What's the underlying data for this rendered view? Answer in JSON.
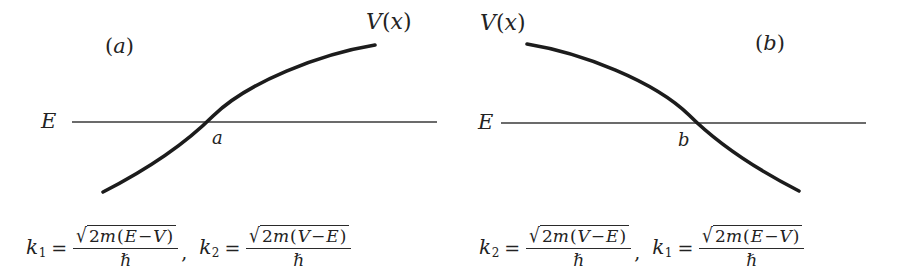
{
  "figure": {
    "line_color": "#2a2a2a",
    "curve_color": "#1c1c1c",
    "background": "#ffffff"
  },
  "panel_a": {
    "tag": "(",
    "tag_letter": "a",
    "tag_close": ")",
    "potential_label": "V",
    "potential_arg_open": "(",
    "potential_arg": "x",
    "potential_arg_close": ")",
    "energy_label": "E",
    "turning_point_label": "a",
    "description": "Potential V(x) rising through the energy level E at turning point a"
  },
  "panel_b": {
    "tag": "(",
    "tag_letter": "b",
    "tag_close": ")",
    "potential_label": "V",
    "potential_arg_open": "(",
    "potential_arg": "x",
    "potential_arg_close": ")",
    "energy_label": "E",
    "turning_point_label": "b",
    "description": "Potential V(x) falling through the energy level E at turning point b"
  },
  "formula_left": {
    "first": {
      "symbol": "k",
      "subscript": "1",
      "equals": "=",
      "radical": "√",
      "numerator_coeff": "2",
      "numerator_mass": "m",
      "paren_open": "(",
      "term_a": "E",
      "minus": "−",
      "term_b": "V",
      "paren_close": ")",
      "denominator": "ℏ"
    },
    "separator": ",",
    "second": {
      "symbol": "k",
      "subscript": "2",
      "equals": "=",
      "radical": "√",
      "numerator_coeff": "2",
      "numerator_mass": "m",
      "paren_open": "(",
      "term_a": "V",
      "minus": "−",
      "term_b": "E",
      "paren_close": ")",
      "denominator": "ℏ"
    }
  },
  "formula_right": {
    "first": {
      "symbol": "k",
      "subscript": "2",
      "equals": "=",
      "radical": "√",
      "numerator_coeff": "2",
      "numerator_mass": "m",
      "paren_open": "(",
      "term_a": "V",
      "minus": "−",
      "term_b": "E",
      "paren_close": ")",
      "denominator": "ℏ"
    },
    "separator": ",",
    "second": {
      "symbol": "k",
      "subscript": "1",
      "equals": "=",
      "radical": "√",
      "numerator_coeff": "2",
      "numerator_mass": "m",
      "paren_open": "(",
      "term_a": "E",
      "minus": "−",
      "term_b": "V",
      "paren_close": ")",
      "denominator": "ℏ"
    }
  }
}
